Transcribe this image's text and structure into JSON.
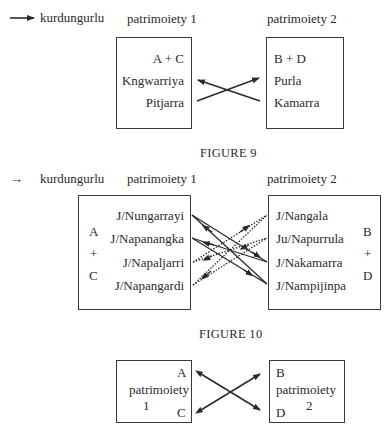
{
  "legend": {
    "arrow_label": "kurdungurlu"
  },
  "figure8": {
    "header_left": "patrimoiety 1",
    "header_right": "patrimoiety 2",
    "left_box": {
      "section": "A + C",
      "items": [
        "Kngwarriya",
        "Pitjarra"
      ]
    },
    "right_box": {
      "section": "B + D",
      "items": [
        "Purla",
        "Kamarra"
      ]
    },
    "caption": "FIGURE 9"
  },
  "figure9": {
    "header_left": "patrimoiety 1",
    "header_right": "patrimoiety 2",
    "left_box": {
      "section": [
        "A",
        "+",
        "C"
      ],
      "items": [
        "J/Nungarrayi",
        "J/Napanangka",
        "J/Napaljarri",
        "J/Napangardi"
      ]
    },
    "right_box": {
      "section": [
        "B",
        "+",
        "D"
      ],
      "items": [
        "J/Nangala",
        "Ju/Napurrula",
        "J/Nakamarra",
        "J/Nampijinpa"
      ]
    },
    "caption": "FIGURE 10"
  },
  "figure10": {
    "left_box": {
      "top": "A",
      "label": "patrimoiety",
      "number": "1",
      "bottom": "C"
    },
    "right_box": {
      "top": "B",
      "label": "patrimoiety",
      "number": "2",
      "bottom": "D"
    }
  }
}
